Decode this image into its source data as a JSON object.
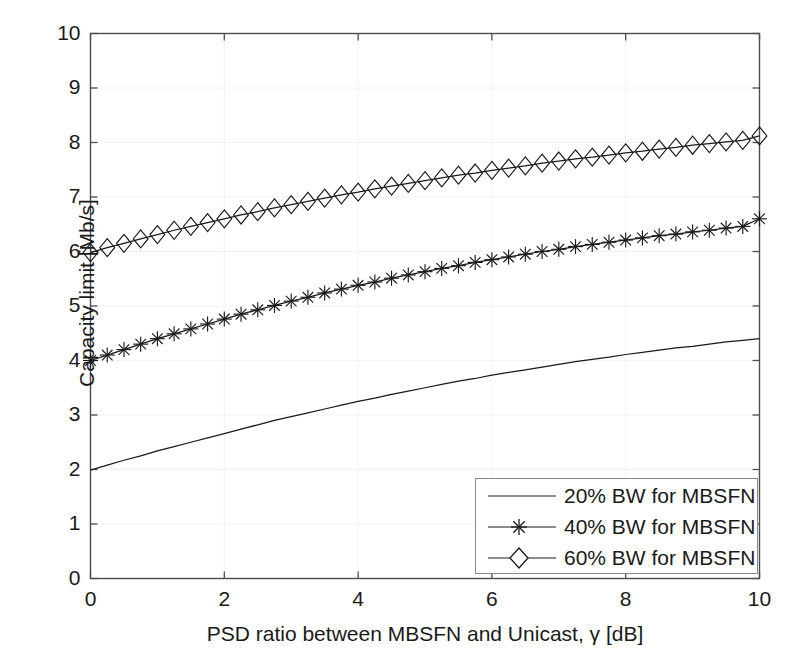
{
  "chart_data": {
    "type": "line",
    "title": "",
    "subtitle": "",
    "xlabel": "PSD ratio between MBSFN and Unicast, γ [dB]",
    "ylabel": "Capacity limit [Mb/s]",
    "xlim": [
      0,
      10
    ],
    "ylim": [
      0,
      10
    ],
    "xticks": [
      0,
      2,
      4,
      6,
      8,
      10
    ],
    "yticks": [
      0,
      1,
      2,
      3,
      4,
      5,
      6,
      7,
      8,
      9,
      10
    ],
    "xtick_labels": [
      "0",
      "2",
      "4",
      "6",
      "8",
      "10"
    ],
    "ytick_labels": [
      "0",
      "1",
      "2",
      "3",
      "4",
      "5",
      "6",
      "7",
      "8",
      "9",
      "10"
    ],
    "grid": true,
    "grid_color": "#f2f2f2",
    "axes_color": "#4d4d4d",
    "line_color": "#1a1a1a",
    "background": "#ffffff",
    "legend_position": "lower right",
    "legend_entries": [
      {
        "label": "20% BW for MBSFN",
        "marker": "none"
      },
      {
        "label": "40% BW for MBSFN",
        "marker": "star"
      },
      {
        "label": "60% BW for MBSFN",
        "marker": "diamond"
      }
    ],
    "x": [
      0,
      0.25,
      0.5,
      0.75,
      1,
      1.25,
      1.5,
      1.75,
      2,
      2.25,
      2.5,
      2.75,
      3,
      3.25,
      3.5,
      3.75,
      4,
      4.25,
      4.5,
      4.75,
      5,
      5.25,
      5.5,
      5.75,
      6,
      6.25,
      6.5,
      6.75,
      7,
      7.25,
      7.5,
      7.75,
      8,
      8.25,
      8.5,
      8.75,
      9,
      9.25,
      9.5,
      9.75,
      10
    ],
    "series": [
      {
        "name": "20% BW for MBSFN",
        "marker": "none",
        "values": [
          1.99,
          2.08,
          2.17,
          2.25,
          2.34,
          2.42,
          2.5,
          2.58,
          2.66,
          2.74,
          2.82,
          2.9,
          2.97,
          3.04,
          3.11,
          3.18,
          3.25,
          3.31,
          3.38,
          3.44,
          3.5,
          3.56,
          3.62,
          3.67,
          3.73,
          3.78,
          3.83,
          3.88,
          3.93,
          3.98,
          4.02,
          4.06,
          4.11,
          4.15,
          4.19,
          4.23,
          4.26,
          4.3,
          4.34,
          4.37,
          4.4
        ]
      },
      {
        "name": "40% BW for MBSFN",
        "marker": "star",
        "values": [
          4.0,
          4.1,
          4.2,
          4.3,
          4.4,
          4.49,
          4.58,
          4.67,
          4.76,
          4.85,
          4.93,
          5.01,
          5.09,
          5.16,
          5.24,
          5.31,
          5.38,
          5.44,
          5.51,
          5.57,
          5.63,
          5.69,
          5.74,
          5.8,
          5.85,
          5.9,
          5.95,
          6.0,
          6.04,
          6.09,
          6.13,
          6.17,
          6.21,
          6.25,
          6.29,
          6.32,
          6.36,
          6.39,
          6.43,
          6.46,
          6.6
        ]
      },
      {
        "name": "60% BW for MBSFN",
        "marker": "diamond",
        "values": [
          5.98,
          6.07,
          6.15,
          6.23,
          6.31,
          6.39,
          6.46,
          6.53,
          6.6,
          6.67,
          6.73,
          6.8,
          6.86,
          6.92,
          6.98,
          7.04,
          7.09,
          7.15,
          7.2,
          7.25,
          7.3,
          7.35,
          7.4,
          7.44,
          7.49,
          7.53,
          7.57,
          7.62,
          7.66,
          7.7,
          7.73,
          7.77,
          7.81,
          7.84,
          7.88,
          7.91,
          7.95,
          7.98,
          8.01,
          8.04,
          8.12
        ]
      }
    ]
  }
}
